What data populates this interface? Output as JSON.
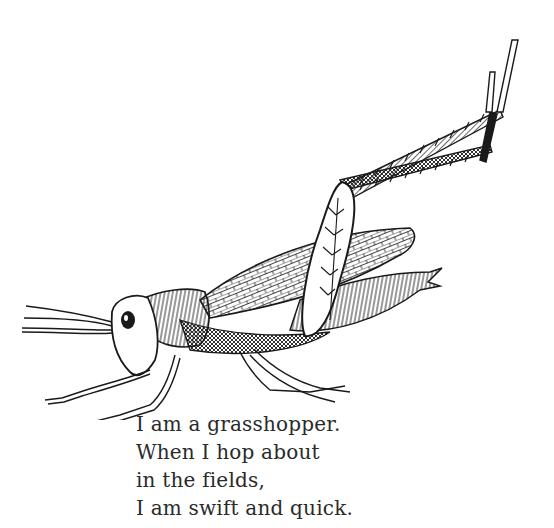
{
  "illustration": {
    "subject": "grasshopper",
    "style": "pen-and-ink line drawing",
    "colors": {
      "ink": "#1a1a1a",
      "paper": "#ffffff"
    }
  },
  "poem": {
    "lines": [
      "I am a grasshopper.",
      "When I hop about",
      "in the fields,",
      "I am swift and quick."
    ]
  }
}
